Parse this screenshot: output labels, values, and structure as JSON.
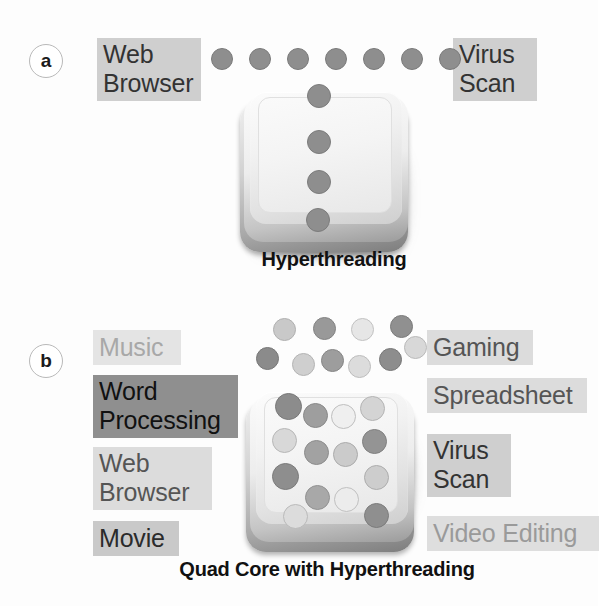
{
  "figure": {
    "title_a_caption": "Hyperthreading",
    "title_b_caption": "Quad Core with Hyperthreading"
  },
  "panel_a": {
    "badge": "a",
    "caption": "Hyperthreading",
    "labels": [
      {
        "text": "Web\nBrowser",
        "tone": "tone-mid",
        "x": 97,
        "y": 38,
        "w": 104
      },
      {
        "text": "Virus\nScan",
        "tone": "tone-mid",
        "x": 453,
        "y": 38,
        "w": 84
      }
    ],
    "queue_dots": {
      "count": 7,
      "color": "#8e8e8e",
      "border": "#7a7a7a",
      "size": 22,
      "y": 48,
      "x_start": 211,
      "x_step": 38
    },
    "core_dots": [
      {
        "x": 307,
        "y": 84,
        "d": 24,
        "color": "#8e8e8e",
        "border": "#7c7c7c"
      },
      {
        "x": 307,
        "y": 130,
        "d": 24,
        "color": "#8e8e8e",
        "border": "#7c7c7c"
      },
      {
        "x": 307,
        "y": 170,
        "d": 24,
        "color": "#8e8e8e",
        "border": "#7c7c7c"
      },
      {
        "x": 306,
        "y": 208,
        "d": 24,
        "color": "#8e8e8e",
        "border": "#7c7c7c"
      }
    ],
    "chip": {
      "x": 238,
      "y": 88,
      "w": 176,
      "h": 170
    }
  },
  "panel_b": {
    "badge": "b",
    "caption": "Quad Core with Hyperthreading",
    "labels_left": [
      {
        "text": "Music",
        "tone": "tone-pale",
        "x": 93,
        "y": 330,
        "w": 88
      },
      {
        "text": "Word\nProcessing",
        "tone": "tone-dark",
        "x": 93,
        "y": 375,
        "w": 145
      },
      {
        "text": "Web\nBrowser",
        "tone": "tone-light",
        "x": 93,
        "y": 447,
        "w": 119
      },
      {
        "text": "Movie",
        "tone": "tone-strong",
        "x": 93,
        "y": 521,
        "w": 86
      }
    ],
    "labels_right": [
      {
        "text": "Gaming",
        "tone": "tone-light",
        "x": 427,
        "y": 330,
        "w": 106
      },
      {
        "text": "Spreadsheet",
        "tone": "tone-light",
        "x": 427,
        "y": 378,
        "w": 160
      },
      {
        "text": "Virus\nScan",
        "tone": "tone-mid",
        "x": 427,
        "y": 434,
        "w": 84
      },
      {
        "text": "Video Editing",
        "tone": "tone-faint",
        "x": 427,
        "y": 516,
        "w": 172
      }
    ],
    "queue_dots": [
      {
        "x": 273,
        "y": 318,
        "d": 23,
        "color": "#c9c9c9",
        "border": "#b0b0b0"
      },
      {
        "x": 313,
        "y": 317,
        "d": 23,
        "color": "#999999",
        "border": "#838383"
      },
      {
        "x": 351,
        "y": 318,
        "d": 23,
        "color": "#e6e6e6",
        "border": "#c2c2c2"
      },
      {
        "x": 390,
        "y": 315,
        "d": 23,
        "color": "#909090",
        "border": "#7b7b7b"
      },
      {
        "x": 256,
        "y": 347,
        "d": 23,
        "color": "#8b8b8b",
        "border": "#777777"
      },
      {
        "x": 292,
        "y": 353,
        "d": 23,
        "color": "#cfcfcf",
        "border": "#b4b4b4"
      },
      {
        "x": 321,
        "y": 349,
        "d": 23,
        "color": "#9d9d9d",
        "border": "#868686"
      },
      {
        "x": 348,
        "y": 355,
        "d": 23,
        "color": "#dcdcdc",
        "border": "#bdbdbd"
      },
      {
        "x": 379,
        "y": 348,
        "d": 23,
        "color": "#8d8d8d",
        "border": "#787878"
      },
      {
        "x": 404,
        "y": 336,
        "d": 23,
        "color": "#d8d8d8",
        "border": "#b9b9b9"
      }
    ],
    "core_dots": [
      {
        "x": 275,
        "y": 393,
        "d": 27,
        "color": "#8c8c8c",
        "border": "#787878"
      },
      {
        "x": 303,
        "y": 403,
        "d": 25,
        "color": "#9e9e9e",
        "border": "#898989"
      },
      {
        "x": 331,
        "y": 404,
        "d": 25,
        "color": "#efefef",
        "border": "#bfbfbf"
      },
      {
        "x": 360,
        "y": 396,
        "d": 25,
        "color": "#d4d4d4",
        "border": "#b4b4b4"
      },
      {
        "x": 272,
        "y": 428,
        "d": 25,
        "color": "#d8d8d8",
        "border": "#b7b7b7"
      },
      {
        "x": 304,
        "y": 440,
        "d": 25,
        "color": "#a2a2a2",
        "border": "#8c8c8c"
      },
      {
        "x": 333,
        "y": 442,
        "d": 25,
        "color": "#cbcbcb",
        "border": "#ababab"
      },
      {
        "x": 362,
        "y": 429,
        "d": 25,
        "color": "#949494",
        "border": "#808080"
      },
      {
        "x": 272,
        "y": 463,
        "d": 27,
        "color": "#8e8e8e",
        "border": "#7a7a7a"
      },
      {
        "x": 364,
        "y": 465,
        "d": 25,
        "color": "#cdcdcd",
        "border": "#adadad"
      },
      {
        "x": 305,
        "y": 485,
        "d": 25,
        "color": "#a8a8a8",
        "border": "#919191"
      },
      {
        "x": 334,
        "y": 487,
        "d": 25,
        "color": "#ececec",
        "border": "#c0c0c0"
      },
      {
        "x": 283,
        "y": 504,
        "d": 25,
        "color": "#dcdcdc",
        "border": "#bababa"
      },
      {
        "x": 364,
        "y": 503,
        "d": 25,
        "color": "#8f8f8f",
        "border": "#7b7b7b"
      }
    ],
    "chip": {
      "x": 244,
      "y": 388,
      "w": 176,
      "h": 135
    }
  }
}
